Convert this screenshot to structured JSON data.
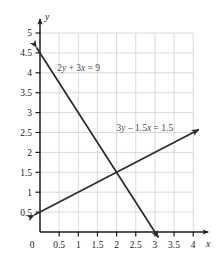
{
  "chart_data": {
    "type": "line",
    "title": "",
    "subtitle": "",
    "xlabel": "x",
    "ylabel": "y",
    "xlim": [
      0,
      4
    ],
    "ylim": [
      0,
      5
    ],
    "grid": true,
    "grid_step_x": 0.5,
    "grid_step_y": 0.5,
    "grid_color": "#d6d6d6",
    "axis_color": "#1a1a1a",
    "line_color": "#2b2b2b",
    "legend": "none",
    "xticks": [
      "0",
      "0.5",
      "1",
      "1.5",
      "2",
      "2.5",
      "3",
      "3.5",
      "4"
    ],
    "xtick_values": [
      0,
      0.5,
      1,
      1.5,
      2,
      2.5,
      3,
      3.5,
      4
    ],
    "yticks": [
      "0.5",
      "1",
      "1.5",
      "2",
      "2.5",
      "3",
      "3.5",
      "4",
      "4.5",
      "5"
    ],
    "ytick_values": [
      0.5,
      1,
      1.5,
      2,
      2.5,
      3,
      3.5,
      4,
      4.5,
      5
    ],
    "origin_label": "0",
    "series": [
      {
        "name": "2y + 3x = 9",
        "label": "2y + 3x = 9",
        "label_parts": [
          "2",
          "y",
          " + 3",
          "x",
          " = 9"
        ],
        "label_x": 0.45,
        "label_y": 4.05,
        "slope": -1.5,
        "intercept": 4.5,
        "x": [
          0,
          3
        ],
        "y": [
          4.5,
          0
        ],
        "arrow_start": true,
        "arrow_end": true
      },
      {
        "name": "3y - 1.5x = 1.5",
        "label": "3y – 1.5x = 1.5",
        "label_parts": [
          "3",
          "y",
          " – 1.5",
          "x",
          " = 1.5"
        ],
        "label_x": 2.0,
        "label_y": 2.53,
        "slope": 0.5,
        "intercept": 0.5,
        "x": [
          0,
          4
        ],
        "y": [
          0.5,
          2.5
        ],
        "arrow_start": true,
        "arrow_end": true
      }
    ],
    "annotations": [
      {
        "name": "intersection",
        "x": 2,
        "y": 1.5,
        "visible": false
      }
    ]
  }
}
